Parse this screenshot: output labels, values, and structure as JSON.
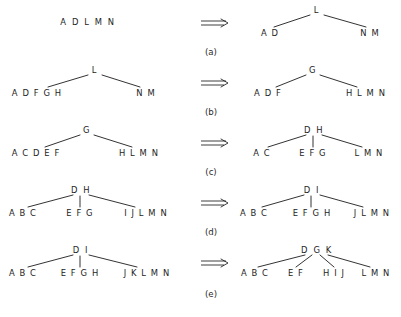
{
  "figure": {
    "background_color": "#ffffff",
    "ink_color": "#1c1c1c",
    "arrow_glyph": "=>",
    "arrow_name": "double-right-arrow"
  },
  "rows": [
    {
      "caption": "(a)",
      "left": {
        "kind": "flat",
        "root": "A D L M N",
        "children": []
      },
      "right": {
        "kind": "tree",
        "root": "L",
        "children": [
          "A D",
          "N M"
        ]
      }
    },
    {
      "caption": "(b)",
      "left": {
        "kind": "tree",
        "root": "L",
        "children": [
          "A D F G H",
          "N M"
        ]
      },
      "right": {
        "kind": "tree",
        "root": "G",
        "children": [
          "A D F",
          "H L M N"
        ]
      }
    },
    {
      "caption": "(c)",
      "left": {
        "kind": "tree",
        "root": "G",
        "children": [
          "A C D E F",
          "H L M N"
        ]
      },
      "right": {
        "kind": "tree",
        "root": "D H",
        "children": [
          "A C",
          "E F G",
          "L M N"
        ]
      }
    },
    {
      "caption": "(d)",
      "left": {
        "kind": "tree",
        "root": "D H",
        "children": [
          "A B C",
          "E F G",
          "I J L M N"
        ]
      },
      "right": {
        "kind": "tree",
        "root": "D I",
        "children": [
          "A B C",
          "E F G H",
          "J L M N"
        ]
      }
    },
    {
      "caption": "(e)",
      "left": {
        "kind": "tree",
        "root": "D I",
        "children": [
          "A B C",
          "E F G H",
          "J K L M N"
        ]
      },
      "right": {
        "kind": "tree",
        "root": "D G K",
        "children": [
          "A B C",
          "E F",
          "H I J",
          "L M N"
        ]
      }
    }
  ]
}
